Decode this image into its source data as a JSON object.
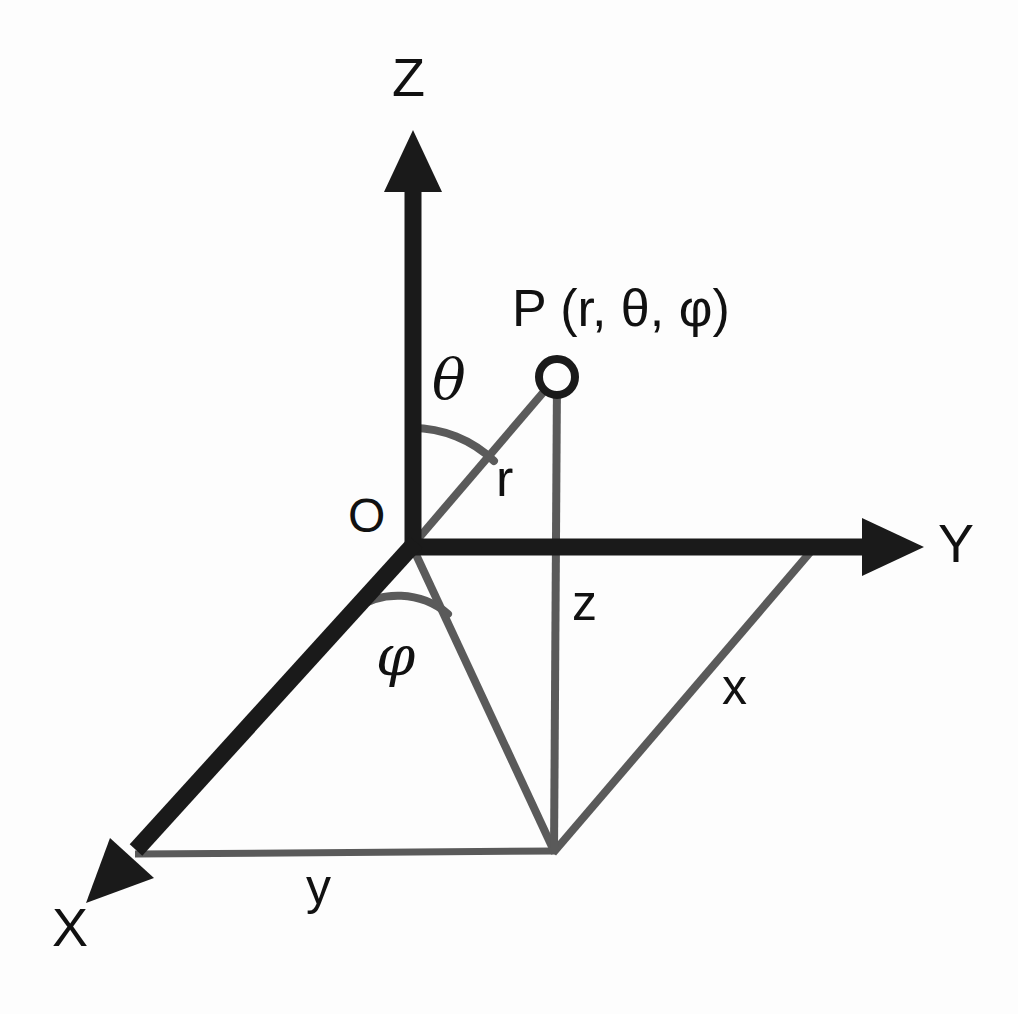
{
  "figure": {
    "background_color": "#fdfdfd",
    "axis_color": "#1a1a1a",
    "construction_color": "#5a5a5a",
    "label_color": "#111111"
  },
  "axes": [
    {
      "name": "z-axis",
      "label": "Z",
      "label_x": 392,
      "label_y": 50,
      "tip_x": 412,
      "tip_y": 133,
      "origin_x": 412,
      "origin_y": 546,
      "style": "thick-black-arrow"
    },
    {
      "name": "y-axis",
      "label": "Y",
      "label_x": 938,
      "label_y": 516,
      "tip_x": 922,
      "tip_y": 547,
      "origin_x": 412,
      "origin_y": 546,
      "style": "thick-black-arrow"
    },
    {
      "name": "x-axis",
      "label": "X",
      "label_x": 52,
      "label_y": 900,
      "tip_x": 88,
      "tip_y": 900,
      "origin_x": 412,
      "origin_y": 546,
      "style": "thick-black-arrow"
    }
  ],
  "origin": {
    "label": "O",
    "label_x": 348,
    "label_y": 492,
    "x": 412,
    "y": 546
  },
  "point": {
    "marker": "open-circle",
    "marker_x": 557,
    "marker_y": 377,
    "marker_radius": 17,
    "label": "P (r, θ, φ)",
    "label_x": 512,
    "label_y": 282
  },
  "components": [
    {
      "name": "radius-r",
      "label": "r",
      "label_x": 496,
      "label_y": 452,
      "from_x": 412,
      "from_y": 546,
      "to_x": 557,
      "to_y": 377
    },
    {
      "name": "height-z",
      "label": "z",
      "label_x": 572,
      "label_y": 578,
      "from_x": 557,
      "from_y": 377,
      "to_x": 554,
      "to_y": 851
    },
    {
      "name": "side-x",
      "label": "x",
      "label_x": 722,
      "label_y": 662,
      "from_x": 554,
      "from_y": 851,
      "to_x": 812,
      "to_y": 549
    },
    {
      "name": "side-y",
      "label": "y",
      "label_x": 306,
      "label_y": 862,
      "from_x": 135,
      "from_y": 854,
      "to_x": 554,
      "to_y": 851
    }
  ],
  "angles": [
    {
      "name": "theta",
      "label": "θ",
      "label_x": 432,
      "label_y": 352,
      "vertex_x": 412,
      "vertex_y": 546,
      "radius": 118,
      "between": [
        "z-axis",
        "radius-r"
      ]
    },
    {
      "name": "phi",
      "label": "φ",
      "label_x": 376,
      "label_y": 628,
      "vertex_x": 412,
      "vertex_y": 546,
      "radius": 78,
      "between": [
        "x-axis",
        "projection-line"
      ]
    }
  ],
  "construction_lines": [
    {
      "name": "projection-line",
      "from_x": 412,
      "from_y": 546,
      "to_x": 554,
      "to_y": 851
    },
    {
      "name": "base-edge-lower",
      "from_x": 135,
      "from_y": 854,
      "to_x": 554,
      "to_y": 851
    },
    {
      "name": "base-edge-right",
      "from_x": 554,
      "from_y": 851,
      "to_x": 812,
      "to_y": 549
    },
    {
      "name": "vertical-drop",
      "from_x": 557,
      "from_y": 377,
      "to_x": 554,
      "to_y": 851
    }
  ]
}
